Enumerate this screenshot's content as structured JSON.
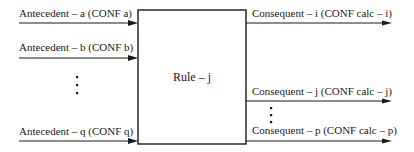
{
  "diagram": {
    "rule": {
      "label": "Rule – j"
    },
    "antecedents": [
      {
        "label": "Antecedent – a  (CONF  a)"
      },
      {
        "label": "Antecedent – b  (CONF  b)"
      },
      {
        "label": "Antecedent – q  (CONF  q)"
      }
    ],
    "consequents": [
      {
        "label": "Consequent – i  (CONF  calc – i)"
      },
      {
        "label": "Consequent – j  (CONF  calc – j)"
      },
      {
        "label": "Consequent – p  (CONF  calc – p)"
      }
    ],
    "ellipsis": {
      "antecedents": "vertical-ellipsis-icon",
      "consequents": "vertical-ellipsis-icon"
    },
    "colors": {
      "stroke": "#1a1a1a",
      "background": "#ffffff"
    }
  }
}
